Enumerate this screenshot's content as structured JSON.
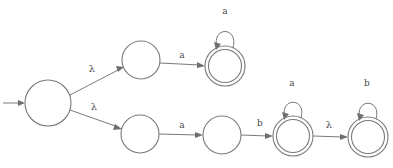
{
  "diagram": {
    "type": "state-machine",
    "background_color": "#ffffff",
    "stroke_color": "#7a7a7a",
    "label_color": "#4a4a4a",
    "start_marker": {
      "name": "start-arrow",
      "from_x": 3,
      "to_x": 25,
      "y": 103
    },
    "states": [
      {
        "id": "q0",
        "cx": 48,
        "cy": 103,
        "r": 23,
        "accepting": false
      },
      {
        "id": "q1",
        "cx": 141,
        "cy": 60,
        "r": 19,
        "accepting": false
      },
      {
        "id": "q2",
        "cx": 225,
        "cy": 66,
        "r": 20,
        "accepting": true
      },
      {
        "id": "q3",
        "cx": 140,
        "cy": 134,
        "r": 19,
        "accepting": false
      },
      {
        "id": "q4",
        "cx": 222,
        "cy": 135,
        "r": 19,
        "accepting": false
      },
      {
        "id": "q5",
        "cx": 293,
        "cy": 136,
        "r": 20,
        "accepting": true
      },
      {
        "id": "q6",
        "cx": 368,
        "cy": 137,
        "r": 20,
        "accepting": true
      }
    ],
    "transitions": [
      {
        "id": "t0",
        "from": "q0",
        "to": "q1",
        "label": "λ",
        "label_x": 92,
        "label_y": 72,
        "greek": true
      },
      {
        "id": "t1",
        "from": "q0",
        "to": "q3",
        "label": "λ",
        "label_x": 94,
        "label_y": 110,
        "greek": true
      },
      {
        "id": "t2",
        "from": "q1",
        "to": "q2",
        "label": "a",
        "label_x": 182,
        "label_y": 58,
        "greek": false
      },
      {
        "id": "t3",
        "from": "q3",
        "to": "q4",
        "label": "a",
        "label_x": 182,
        "label_y": 128,
        "greek": false
      },
      {
        "id": "t4",
        "from": "q4",
        "to": "q5",
        "label": "b",
        "label_x": 260,
        "label_y": 126,
        "greek": false
      },
      {
        "id": "t5",
        "from": "q5",
        "to": "q6",
        "label": "λ",
        "label_x": 329,
        "label_y": 128,
        "greek": true
      }
    ],
    "self_loops": [
      {
        "id": "l0",
        "on": "q2",
        "label": "a",
        "label_x": 225,
        "label_y": 14
      },
      {
        "id": "l1",
        "on": "q5",
        "label": "a",
        "label_x": 292,
        "label_y": 86
      },
      {
        "id": "l2",
        "on": "q6",
        "label": "b",
        "label_x": 367,
        "label_y": 86
      }
    ],
    "alphabet": [
      "a",
      "b",
      "λ"
    ],
    "accepting_state_ids": [
      "q2",
      "q5",
      "q6"
    ],
    "start_state_id": "q0"
  }
}
